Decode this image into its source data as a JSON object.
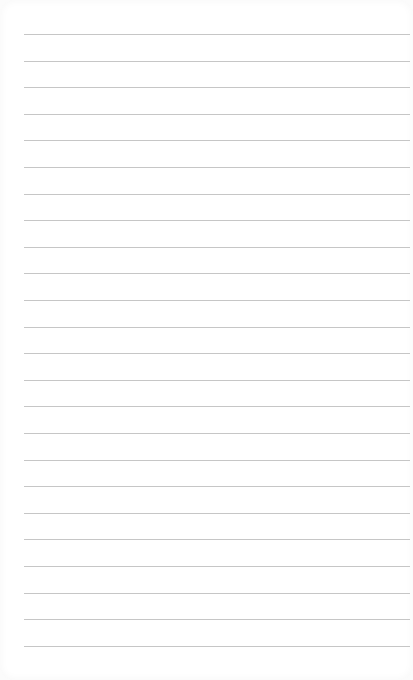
{
  "paper": {
    "type": "lined-notepad-page",
    "line_count": 24,
    "first_line_y": 34,
    "line_spacing": 26.6,
    "line_left": 24,
    "line_width": 386,
    "colors": {
      "background": "#ffffff",
      "rule": "#c6c6c6"
    }
  }
}
